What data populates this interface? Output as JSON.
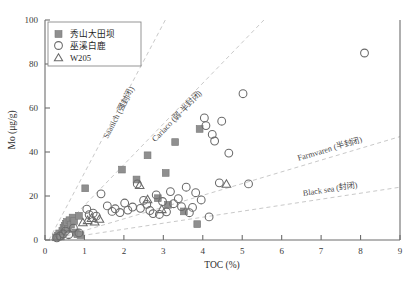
{
  "chart_data": {
    "type": "scatter",
    "title": "",
    "xlabel": "TOC (%)",
    "ylabel": "Mo (μg/g)",
    "xlim": [
      0,
      9
    ],
    "ylim": [
      0,
      100
    ],
    "xticks": [
      0,
      1,
      2,
      3,
      4,
      5,
      6,
      7,
      8,
      9
    ],
    "yticks": [
      0,
      20,
      40,
      60,
      80,
      100
    ],
    "grid": false,
    "legend_position": "top-left",
    "series": [
      {
        "name": "秀山大田坝",
        "marker": "filled-square",
        "color": "#8f8f8f",
        "points": [
          [
            0.28,
            1.2
          ],
          [
            0.33,
            2.0
          ],
          [
            0.36,
            3.0
          ],
          [
            0.4,
            1.6
          ],
          [
            0.44,
            4.2
          ],
          [
            0.47,
            5.6
          ],
          [
            0.5,
            6.4
          ],
          [
            0.53,
            7.4
          ],
          [
            0.56,
            8.2
          ],
          [
            0.58,
            5.0
          ],
          [
            0.62,
            9.0
          ],
          [
            0.66,
            7.0
          ],
          [
            0.7,
            10.2
          ],
          [
            0.74,
            8.6
          ],
          [
            0.78,
            3.4
          ],
          [
            0.82,
            2.6
          ],
          [
            0.86,
            11.0
          ],
          [
            0.9,
            2.2
          ],
          [
            1.02,
            23.5
          ],
          [
            1.95,
            32.0
          ],
          [
            2.32,
            27.5
          ],
          [
            2.6,
            38.5
          ],
          [
            2.86,
            19.0
          ],
          [
            3.06,
            30.5
          ],
          [
            3.12,
            16.0
          ],
          [
            3.3,
            44.5
          ],
          [
            3.52,
            13.0
          ],
          [
            3.86,
            7.2
          ],
          [
            3.92,
            50.5
          ]
        ]
      },
      {
        "name": "巫溪白鹿",
        "marker": "open-circle",
        "color": "#6a6a6a",
        "points": [
          [
            0.3,
            1.0
          ],
          [
            0.38,
            1.8
          ],
          [
            0.46,
            2.8
          ],
          [
            0.52,
            4.0
          ],
          [
            0.6,
            2.4
          ],
          [
            0.72,
            5.4
          ],
          [
            0.86,
            3.2
          ],
          [
            1.06,
            14.0
          ],
          [
            1.12,
            11.5
          ],
          [
            1.22,
            12.2
          ],
          [
            1.3,
            10.8
          ],
          [
            1.42,
            21.0
          ],
          [
            1.58,
            15.5
          ],
          [
            1.7,
            13.0
          ],
          [
            1.78,
            14.2
          ],
          [
            1.9,
            12.5
          ],
          [
            2.02,
            16.8
          ],
          [
            2.1,
            13.6
          ],
          [
            2.22,
            15.0
          ],
          [
            2.34,
            25.5
          ],
          [
            2.42,
            14.4
          ],
          [
            2.5,
            18.0
          ],
          [
            2.58,
            16.2
          ],
          [
            2.66,
            13.4
          ],
          [
            2.74,
            12.0
          ],
          [
            2.82,
            20.5
          ],
          [
            2.9,
            11.6
          ],
          [
            2.98,
            17.5
          ],
          [
            3.08,
            12.8
          ],
          [
            3.18,
            22.0
          ],
          [
            3.26,
            16.5
          ],
          [
            3.38,
            18.8
          ],
          [
            3.46,
            15.2
          ],
          [
            3.58,
            24.0
          ],
          [
            3.66,
            12.4
          ],
          [
            3.74,
            14.8
          ],
          [
            3.82,
            21.5
          ],
          [
            3.96,
            18.2
          ],
          [
            4.04,
            55.5
          ],
          [
            4.08,
            52.0
          ],
          [
            4.16,
            10.5
          ],
          [
            4.24,
            48.0
          ],
          [
            4.3,
            45.0
          ],
          [
            4.42,
            26.0
          ],
          [
            4.48,
            54.0
          ],
          [
            4.66,
            39.5
          ],
          [
            5.02,
            66.5
          ],
          [
            5.16,
            25.5
          ],
          [
            8.1,
            85.0
          ]
        ]
      },
      {
        "name": "W205",
        "marker": "open-triangle",
        "color": "#6a6a6a",
        "points": [
          [
            0.96,
            8.0
          ],
          [
            1.08,
            9.0
          ],
          [
            1.18,
            10.0
          ],
          [
            1.26,
            8.4
          ],
          [
            1.38,
            9.6
          ],
          [
            2.4,
            25.0
          ],
          [
            2.6,
            18.5
          ],
          [
            2.96,
            14.0
          ],
          [
            4.6,
            25.5
          ]
        ]
      }
    ],
    "trendlines": [
      {
        "label": "Saanich (强封闭)",
        "from": [
          0.1,
          0
        ],
        "to": [
          3.05,
          100
        ]
      },
      {
        "label": "Cariaco (弱-半封闭)",
        "from": [
          0.15,
          0
        ],
        "to": [
          5.55,
          100
        ]
      },
      {
        "label": "Farmvaren (半封闭)",
        "from": [
          0.2,
          0
        ],
        "to": [
          9.0,
          47
        ]
      },
      {
        "label": "Black sea (封闭)",
        "from": [
          0.2,
          0
        ],
        "to": [
          9.0,
          24
        ]
      }
    ]
  },
  "legend": {
    "items": [
      {
        "label": "秀山大田坝",
        "marker": "filled-square"
      },
      {
        "label": "巫溪白鹿",
        "marker": "open-circle"
      },
      {
        "label": "W205",
        "marker": "open-triangle"
      }
    ]
  }
}
